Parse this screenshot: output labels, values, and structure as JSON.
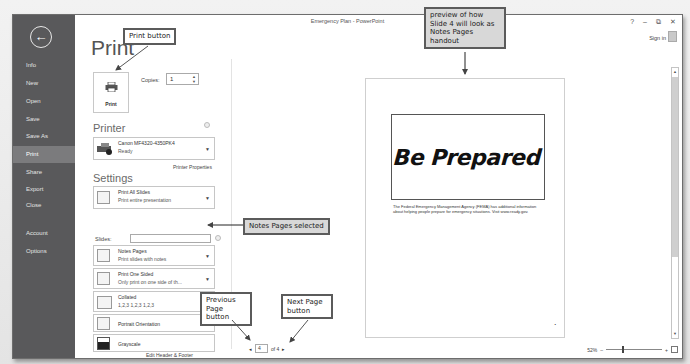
{
  "window": {
    "title": "Emergency Plan - PowerPoint",
    "controls": {
      "help": "?",
      "minimize": "–",
      "restore": "⧉",
      "close": "✕"
    },
    "sign_in": "Sign in"
  },
  "sidebar": {
    "back_icon": "←",
    "items": [
      {
        "label": "Info",
        "active": false
      },
      {
        "label": "New",
        "active": false
      },
      {
        "label": "Open",
        "active": false
      },
      {
        "label": "Save",
        "active": false
      },
      {
        "label": "Save As",
        "active": false
      },
      {
        "label": "Print",
        "active": true
      },
      {
        "label": "Share",
        "active": false
      },
      {
        "label": "Export",
        "active": false
      },
      {
        "label": "Close",
        "active": false
      },
      {
        "label": "Account",
        "active": false
      },
      {
        "label": "Options",
        "active": false
      }
    ]
  },
  "print": {
    "heading": "Print",
    "button_label": "Print",
    "copies_label": "Copies:",
    "copies_value": "1",
    "printer_heading": "Printer",
    "printer": {
      "name": "Canon MF4320-4350PK4",
      "status": "Ready"
    },
    "printer_properties": "Printer Properties",
    "settings_heading": "Settings",
    "settings": [
      {
        "title": "Print All Slides",
        "subtitle": "Print entire presentation"
      },
      {
        "title": "Notes Pages",
        "subtitle": "Print slides with notes"
      },
      {
        "title": "Print One Sided",
        "subtitle": "Only print on one side of th..."
      },
      {
        "title": "Collated",
        "subtitle": "1,2,3    1,2,3    1,2,3"
      },
      {
        "title": "Portrait Orientation",
        "subtitle": ""
      },
      {
        "title": "Grayscale",
        "subtitle": ""
      }
    ],
    "slides_label": "Slides:",
    "slides_value": "",
    "edit_header_footer": "Edit Header & Footer"
  },
  "preview": {
    "slide_title": "Be Prepared",
    "notes": "The Federal Emergency Management Agency (FEMA) has additional information about helping people prepare for emergency situations. Visit www.ready.gov.",
    "page_dot": "•",
    "current_page": "4",
    "of_total": "of 4",
    "prev_arrow": "◂",
    "next_arrow": "▸",
    "zoom_level": "52%",
    "zoom_minus": "–",
    "zoom_plus": "+"
  },
  "callouts": {
    "print_button": "Print button",
    "preview": "preview of how Slide 4 will look as Notes Pages handout",
    "notes_pages": "Notes Pages selected",
    "previous_page": "Previous Page button",
    "next_page": "Next Page button"
  }
}
